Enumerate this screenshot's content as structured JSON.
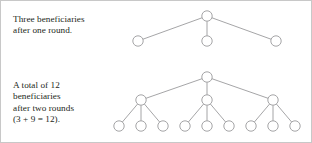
{
  "figure": {
    "background_color": "#ffffff",
    "border_color": "#c8c8c8",
    "node_stroke_color": "#8e8e90",
    "node_fill_color": "#ffffff",
    "edge_color": "#8e8e90",
    "text_color": "#231f20"
  },
  "captions": {
    "round_one": "Three beneficiaries\nafter one round.",
    "round_two": "A total of 12\nbeneficiaries\nafter two rounds\n(3 + 9 = 12)."
  },
  "chart_data": {
    "type": "diagram",
    "title": "",
    "subtitle": "",
    "diagram_kind": "branching-tree",
    "branching_factor": 3,
    "trees": [
      {
        "name": "one-round-tree",
        "levels": 2,
        "label": "Three beneficiaries after one round.",
        "node_count": 4,
        "beneficiary_count": 3,
        "nodes": [
          {
            "id": "r1-root",
            "level": 0,
            "x": 206,
            "y": 15,
            "r": 5.2
          },
          {
            "id": "r1-c1",
            "level": 1,
            "x": 137,
            "y": 40,
            "r": 5.2
          },
          {
            "id": "r1-c2",
            "level": 1,
            "x": 206,
            "y": 40,
            "r": 5.2
          },
          {
            "id": "r1-c3",
            "level": 1,
            "x": 275,
            "y": 40,
            "r": 5.2
          }
        ],
        "edges": [
          {
            "from": "r1-root",
            "to": "r1-c1"
          },
          {
            "from": "r1-root",
            "to": "r1-c2"
          },
          {
            "from": "r1-root",
            "to": "r1-c3"
          }
        ]
      },
      {
        "name": "two-round-tree",
        "levels": 3,
        "label": "A total of 12 beneficiaries after two rounds (3 + 9 = 12).",
        "node_count": 13,
        "beneficiary_count": 12,
        "level_counts": [
          1,
          3,
          9
        ],
        "arithmetic": "3 + 9 = 12",
        "nodes": [
          {
            "id": "r2-root",
            "level": 0,
            "x": 206,
            "y": 76,
            "r": 5.2
          },
          {
            "id": "r2-a",
            "level": 1,
            "x": 140,
            "y": 99,
            "r": 5.2
          },
          {
            "id": "r2-b",
            "level": 1,
            "x": 206,
            "y": 99,
            "r": 5.2
          },
          {
            "id": "r2-c",
            "level": 1,
            "x": 272,
            "y": 99,
            "r": 5.2
          },
          {
            "id": "r2-a1",
            "level": 2,
            "x": 118,
            "y": 125,
            "r": 5.2
          },
          {
            "id": "r2-a2",
            "level": 2,
            "x": 140,
            "y": 125,
            "r": 5.2
          },
          {
            "id": "r2-a3",
            "level": 2,
            "x": 162,
            "y": 125,
            "r": 5.2
          },
          {
            "id": "r2-b1",
            "level": 2,
            "x": 184,
            "y": 125,
            "r": 5.2
          },
          {
            "id": "r2-b2",
            "level": 2,
            "x": 206,
            "y": 125,
            "r": 5.2
          },
          {
            "id": "r2-b3",
            "level": 2,
            "x": 228,
            "y": 125,
            "r": 5.2
          },
          {
            "id": "r2-c1",
            "level": 2,
            "x": 250,
            "y": 125,
            "r": 5.2
          },
          {
            "id": "r2-c2",
            "level": 2,
            "x": 272,
            "y": 125,
            "r": 5.2
          },
          {
            "id": "r2-c3",
            "level": 2,
            "x": 294,
            "y": 125,
            "r": 5.2
          }
        ],
        "edges": [
          {
            "from": "r2-root",
            "to": "r2-a"
          },
          {
            "from": "r2-root",
            "to": "r2-b"
          },
          {
            "from": "r2-root",
            "to": "r2-c"
          },
          {
            "from": "r2-a",
            "to": "r2-a1"
          },
          {
            "from": "r2-a",
            "to": "r2-a2"
          },
          {
            "from": "r2-a",
            "to": "r2-a3"
          },
          {
            "from": "r2-b",
            "to": "r2-b1"
          },
          {
            "from": "r2-b",
            "to": "r2-b2"
          },
          {
            "from": "r2-b",
            "to": "r2-b3"
          },
          {
            "from": "r2-c",
            "to": "r2-c1"
          },
          {
            "from": "r2-c",
            "to": "r2-c2"
          },
          {
            "from": "r2-c",
            "to": "r2-c3"
          }
        ]
      }
    ]
  }
}
